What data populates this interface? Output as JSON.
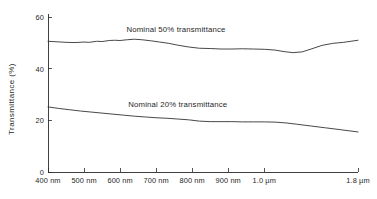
{
  "chart_data": {
    "type": "line",
    "title": "",
    "subtitle": "",
    "xlabel": "",
    "ylabel": "Transmittance (%)",
    "ylim": [
      0,
      60
    ],
    "y_ticks": [
      0,
      20,
      40,
      60
    ],
    "y_tick_labels": [
      "0",
      "20",
      "40",
      "60"
    ],
    "x_tick_labels": [
      "400 nm",
      "500 nm",
      "600 nm",
      "700 nm",
      "800 nm",
      "900 nm",
      "1.0 µm",
      "1.8 µm"
    ],
    "x_tick_positions": [
      0,
      1,
      2,
      3,
      4,
      5,
      6,
      8.6
    ],
    "grid": false,
    "legend_position": "inline-annotation",
    "series": [
      {
        "name": "Nominal 50% transmittance",
        "annotation": "Nominal 50% transmittance",
        "annotation_x": 3.55,
        "annotation_y": 54.2,
        "x": [
          0,
          0.25,
          0.5,
          0.75,
          1.0,
          1.15,
          1.35,
          1.5,
          1.7,
          1.85,
          2.0,
          2.2,
          2.4,
          2.6,
          2.85,
          3.1,
          3.35,
          3.6,
          3.9,
          4.2,
          4.5,
          4.8,
          5.1,
          5.4,
          5.7,
          6.0,
          6.3,
          6.55,
          6.8,
          7.05,
          7.3,
          7.6,
          7.9,
          8.2,
          8.6
        ],
        "values": [
          50.6,
          50.4,
          50.2,
          50.1,
          50.3,
          50.2,
          50.6,
          50.5,
          50.9,
          51.0,
          50.9,
          51.2,
          51.4,
          51.2,
          50.8,
          50.3,
          49.8,
          49.1,
          48.4,
          47.9,
          47.8,
          47.6,
          47.6,
          47.7,
          47.6,
          47.5,
          47.2,
          46.6,
          46.2,
          46.5,
          47.6,
          49.0,
          49.8,
          50.2,
          51.0
        ]
      },
      {
        "name": "Nominal 20% transmittance",
        "annotation": "Nominal 20% transmittance",
        "annotation_x": 3.6,
        "annotation_y": 25.3,
        "x": [
          0,
          0.3,
          0.6,
          0.9,
          1.2,
          1.5,
          1.8,
          2.1,
          2.4,
          2.7,
          3.0,
          3.3,
          3.6,
          3.9,
          4.2,
          4.5,
          4.8,
          5.1,
          5.4,
          5.7,
          6.0,
          6.3,
          6.6,
          6.9,
          7.3,
          7.7,
          8.1,
          8.6
        ],
        "values": [
          25.2,
          24.6,
          24.1,
          23.6,
          23.2,
          22.8,
          22.4,
          22.0,
          21.6,
          21.3,
          21.0,
          20.8,
          20.5,
          20.2,
          19.7,
          19.5,
          19.5,
          19.5,
          19.4,
          19.4,
          19.4,
          19.3,
          19.0,
          18.5,
          17.8,
          17.1,
          16.4,
          15.5
        ]
      }
    ]
  }
}
